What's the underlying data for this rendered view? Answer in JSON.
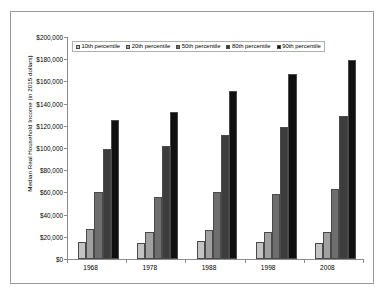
{
  "chart_data": {
    "type": "bar",
    "title": "",
    "xlabel": "",
    "ylabel": "Median Real Household Income (in 2015 dollars)",
    "categories": [
      "1968",
      "1978",
      "1988",
      "1998",
      "2008"
    ],
    "ylim": [
      0,
      200000
    ],
    "ytick_step": 20000,
    "ytick_labels": [
      "$200,000",
      "$180,000",
      "$160,000",
      "$140,000",
      "$120,000",
      "$100,000",
      "$80,000",
      "$60,000",
      "$40,000",
      "$20,000",
      "$0"
    ],
    "ytick_values": [
      200000,
      180000,
      160000,
      140000,
      120000,
      100000,
      80000,
      60000,
      40000,
      20000,
      0
    ],
    "grid": false,
    "legend_position": "top-left-inside",
    "series": [
      {
        "name": "10th percentile",
        "color": "#c3c3c3",
        "values": [
          15000,
          14000,
          16000,
          15000,
          14500
        ]
      },
      {
        "name": "20th percentile",
        "color": "#a0a0a0",
        "values": [
          27000,
          24500,
          26000,
          24000,
          24500
        ]
      },
      {
        "name": "50th percentile",
        "color": "#6e6e6e",
        "values": [
          60000,
          56000,
          60000,
          59000,
          63000
        ]
      },
      {
        "name": "80th percentile",
        "color": "#3d3d3d",
        "values": [
          99000,
          102000,
          112000,
          118500,
          129000
        ]
      },
      {
        "name": "90th percentile",
        "color": "#101010",
        "values": [
          125500,
          132500,
          151000,
          166500,
          179000
        ]
      }
    ]
  },
  "legend": {
    "items": [
      {
        "label": "10th percentile"
      },
      {
        "label": "20th percentile"
      },
      {
        "label": "50th percentile"
      },
      {
        "label": "80th percentile"
      },
      {
        "label": "90th percentile"
      }
    ]
  },
  "colors": {
    "frame_border": "#9a9a9a",
    "axis": "#8c8c8c",
    "bar_outline": "#4a4a4a",
    "background": "#ffffff",
    "text": "#000000"
  }
}
